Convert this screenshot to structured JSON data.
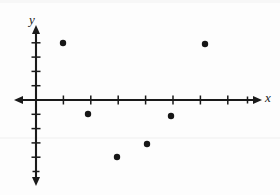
{
  "figure": {
    "width": 280,
    "height": 195,
    "background_color": "#fdfdfd",
    "ink_color": "#1a1a1a",
    "point_color": "#161616"
  },
  "axes": {
    "x_axis": {
      "label": "x",
      "label_style": "italic",
      "pixel_y": 100,
      "pixel_x_start": 14,
      "pixel_x_end": 262,
      "arrow_left": true,
      "arrow_right": true,
      "tick_spacing_px": 27.4,
      "tick_length_px": 9,
      "positive_tick_count": 8,
      "negative_tick_count": 0,
      "tick_values": [
        1,
        2,
        3,
        4,
        5,
        6,
        7,
        8
      ],
      "tick_pixels": [
        63.4,
        90.8,
        118.2,
        145.6,
        173.0,
        200.4,
        227.8,
        255.2
      ],
      "tick_labels_shown": false
    },
    "y_axis": {
      "label": "y",
      "label_style": "italic",
      "pixel_x": 36,
      "pixel_y_top": 25,
      "pixel_y_bottom": 186,
      "arrow_up": true,
      "arrow_down": true,
      "tick_spacing_px": 14.3,
      "tick_length_px": 9,
      "positive_tick_count": 5,
      "negative_tick_count": 5,
      "tick_values": [
        5,
        4,
        3,
        2,
        1,
        -1,
        -2,
        -3,
        -4,
        -5
      ],
      "tick_pixels": [
        28.5,
        42.8,
        57.1,
        71.4,
        85.7,
        114.3,
        128.6,
        142.9,
        157.2,
        171.5
      ],
      "tick_labels_shown": false
    },
    "origin": {
      "pixel_x": 36,
      "pixel_y": 100
    }
  },
  "chart_data": {
    "type": "scatter",
    "title": "",
    "xlabel": "x",
    "ylabel": "y",
    "grid": false,
    "legend_position": "none",
    "xlim": [
      -1,
      9
    ],
    "ylim": [
      -5,
      5
    ],
    "x_tick_step": 1,
    "y_tick_step": 1,
    "x_tick_labels_shown": false,
    "y_tick_labels_shown": false,
    "marker": "filled-circle",
    "marker_radius_px": 3.2,
    "point_count": 6,
    "points": [
      {
        "x": 1,
        "y": 4,
        "pixel_x": 63,
        "pixel_y": 43
      },
      {
        "x": 2,
        "y": -1,
        "pixel_x": 88,
        "pixel_y": 114
      },
      {
        "x": 3,
        "y": -4,
        "pixel_x": 117,
        "pixel_y": 157
      },
      {
        "x": 4,
        "y": -3,
        "pixel_x": 147,
        "pixel_y": 144
      },
      {
        "x": 5,
        "y": -1,
        "pixel_x": 171,
        "pixel_y": 116
      },
      {
        "x": 6,
        "y": 4,
        "pixel_x": 205,
        "pixel_y": 44
      }
    ],
    "x": [
      1,
      2,
      3,
      4,
      5,
      6
    ],
    "values": [
      4,
      -1,
      -4,
      -3,
      -1,
      4
    ],
    "annotations": []
  }
}
